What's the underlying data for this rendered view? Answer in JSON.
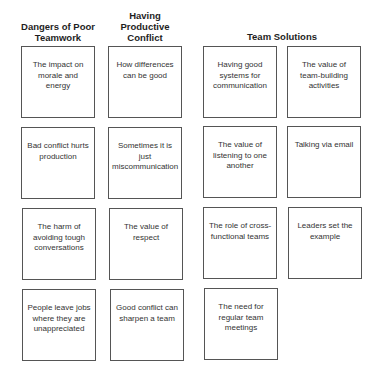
{
  "columns": [
    {
      "header": "Dangers of Poor Teamwork",
      "cards": [
        "The impact on morale and energy",
        "Bad conflict hurts production",
        "The harm of avoiding tough conversations",
        "People leave jobs where they are unappreciated"
      ]
    },
    {
      "header": "Having Productive Conflict",
      "cards": [
        "How differences can be good",
        "Sometimes it is just miscommunication",
        "The value of respect",
        "Good conflict can sharpen a team"
      ]
    },
    {
      "header": "Team Solutions",
      "cards": [
        "Having good systems for communication",
        "The value of listening to one another",
        "The role of cross-functional teams",
        "The need for regular team meetings",
        "The value of team-building activities",
        "Talking via email",
        "Leaders set the example"
      ]
    }
  ]
}
